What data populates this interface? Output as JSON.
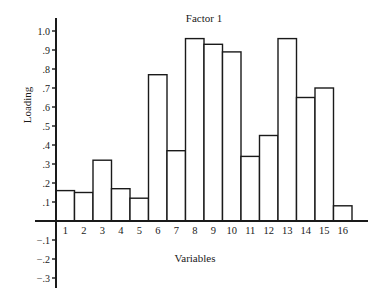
{
  "chart_data": {
    "type": "bar",
    "title": "Factor 1",
    "xlabel": "Variables",
    "ylabel": "Loading",
    "categories": [
      "1",
      "2",
      "3",
      "4",
      "5",
      "6",
      "7",
      "8",
      "9",
      "10",
      "11",
      "12",
      "13",
      "14",
      "15",
      "16"
    ],
    "values": [
      0.16,
      0.15,
      0.32,
      0.17,
      0.12,
      0.77,
      0.37,
      0.96,
      0.93,
      0.89,
      0.34,
      0.45,
      0.96,
      0.65,
      0.7,
      0.08
    ],
    "ylim": [
      -0.35,
      1.05
    ],
    "yticks": [
      1.0,
      0.9,
      0.8,
      0.7,
      0.6,
      0.5,
      0.4,
      0.3,
      0.2,
      0.1,
      -0.1,
      -0.2,
      -0.3
    ],
    "ytick_labels": [
      "1.0",
      ".9",
      ".8",
      ".7",
      ".6",
      ".5",
      ".4",
      ".3",
      ".2",
      ".1",
      "−.1",
      "−.2",
      "−.3"
    ],
    "grid": false,
    "legend": null,
    "bar_fill": "#ffffff",
    "bar_stroke": "#1a1a1a"
  }
}
